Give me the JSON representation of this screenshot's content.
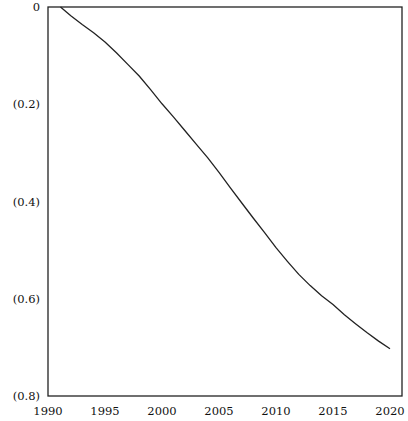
{
  "chart_data": {
    "type": "line",
    "title": "",
    "xlabel": "",
    "ylabel": "",
    "xlim": [
      1990,
      2020
    ],
    "ylim": [
      -0.8,
      0
    ],
    "grid": false,
    "legend": "none",
    "x_ticks": [
      1990,
      1995,
      2000,
      2005,
      2010,
      2015,
      2020
    ],
    "x_tick_labels": [
      "1990",
      "1995",
      "2000",
      "2005",
      "2010",
      "2015",
      "2020"
    ],
    "y_ticks": [
      0,
      -0.2,
      -0.4,
      -0.6,
      -0.8
    ],
    "y_tick_labels": [
      "0",
      "(0.2)",
      "(0.4)",
      "(0.6)",
      "(0.8)"
    ],
    "series": [
      {
        "name": "series",
        "color": "#222222",
        "x": [
          1991.1,
          1992,
          1993,
          1994,
          1995,
          1996,
          1997,
          1998,
          1999,
          2000,
          2001,
          2002,
          2003,
          2004,
          2005,
          2006,
          2007,
          2008,
          2009,
          2010,
          2011,
          2012,
          2013,
          2014,
          2015,
          2016,
          2017,
          2018,
          2019,
          2020
        ],
        "values": [
          0,
          -0.018,
          -0.036,
          -0.053,
          -0.072,
          -0.094,
          -0.118,
          -0.142,
          -0.17,
          -0.199,
          -0.226,
          -0.254,
          -0.282,
          -0.31,
          -0.34,
          -0.372,
          -0.403,
          -0.434,
          -0.464,
          -0.495,
          -0.523,
          -0.55,
          -0.573,
          -0.594,
          -0.612,
          -0.633,
          -0.652,
          -0.67,
          -0.687,
          -0.703
        ]
      }
    ]
  }
}
